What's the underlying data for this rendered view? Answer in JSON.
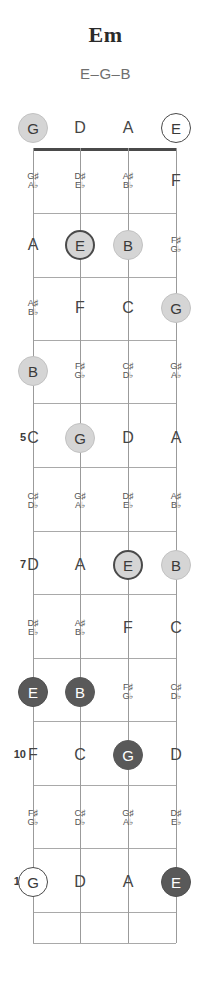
{
  "chord": {
    "name": "Em",
    "notes_label": "E–G–B"
  },
  "fretboard": {
    "tuning": [
      "G",
      "D",
      "A",
      "E"
    ],
    "string_count": 4,
    "fret_count": 12,
    "fret_numbers_shown": [
      "5",
      "7",
      "10",
      "12"
    ],
    "colors": {
      "root_fill": "#595959",
      "chord_fill": "#d5d5d5",
      "open_fill": "#ffffff",
      "line": "#a9a9a9",
      "nut": "#4a4a4a",
      "text": "#3a3a3a"
    },
    "rows": [
      {
        "fret": "0",
        "label": "",
        "cells": [
          {
            "text": "G",
            "style": "chord-light"
          },
          {
            "text": "D",
            "style": "plain"
          },
          {
            "text": "A",
            "style": "plain"
          },
          {
            "text": "E",
            "style": "root-open"
          }
        ]
      },
      {
        "fret": "1",
        "label": "",
        "cells": [
          {
            "text": "G♯|A♭",
            "style": "accidental"
          },
          {
            "text": "D♯|E♭",
            "style": "accidental"
          },
          {
            "text": "A♯|B♭",
            "style": "accidental"
          },
          {
            "text": "F",
            "style": "plain"
          }
        ]
      },
      {
        "fret": "2",
        "label": "",
        "cells": [
          {
            "text": "A",
            "style": "plain"
          },
          {
            "text": "E",
            "style": "root-light"
          },
          {
            "text": "B",
            "style": "chord-light"
          },
          {
            "text": "F♯|G♭",
            "style": "accidental"
          }
        ]
      },
      {
        "fret": "3",
        "label": "",
        "cells": [
          {
            "text": "A♯|B♭",
            "style": "accidental"
          },
          {
            "text": "F",
            "style": "plain"
          },
          {
            "text": "C",
            "style": "plain"
          },
          {
            "text": "G",
            "style": "chord-light"
          }
        ]
      },
      {
        "fret": "4",
        "label": "",
        "cells": [
          {
            "text": "B",
            "style": "chord-light"
          },
          {
            "text": "F♯|G♭",
            "style": "accidental"
          },
          {
            "text": "C♯|D♭",
            "style": "accidental"
          },
          {
            "text": "G♯|A♭",
            "style": "accidental"
          }
        ]
      },
      {
        "fret": "5",
        "label": "5",
        "cells": [
          {
            "text": "C",
            "style": "plain"
          },
          {
            "text": "G",
            "style": "chord-light"
          },
          {
            "text": "D",
            "style": "plain"
          },
          {
            "text": "A",
            "style": "plain"
          }
        ]
      },
      {
        "fret": "6",
        "label": "",
        "cells": [
          {
            "text": "C♯|D♭",
            "style": "accidental"
          },
          {
            "text": "G♯|A♭",
            "style": "accidental"
          },
          {
            "text": "D♯|E♭",
            "style": "accidental"
          },
          {
            "text": "A♯|B♭",
            "style": "accidental"
          }
        ]
      },
      {
        "fret": "7",
        "label": "7",
        "cells": [
          {
            "text": "D",
            "style": "plain"
          },
          {
            "text": "A",
            "style": "plain"
          },
          {
            "text": "E",
            "style": "root-light"
          },
          {
            "text": "B",
            "style": "chord-light"
          }
        ]
      },
      {
        "fret": "8",
        "label": "",
        "cells": [
          {
            "text": "D♯|E♭",
            "style": "accidental"
          },
          {
            "text": "A♯|B♭",
            "style": "accidental"
          },
          {
            "text": "F",
            "style": "plain"
          },
          {
            "text": "C",
            "style": "plain"
          }
        ]
      },
      {
        "fret": "9",
        "label": "",
        "cells": [
          {
            "text": "E",
            "style": "root-dark"
          },
          {
            "text": "B",
            "style": "chord-dark"
          },
          {
            "text": "F♯|G♭",
            "style": "accidental"
          },
          {
            "text": "C♯|D♭",
            "style": "accidental"
          }
        ]
      },
      {
        "fret": "10",
        "label": "10",
        "cells": [
          {
            "text": "F",
            "style": "plain"
          },
          {
            "text": "C",
            "style": "plain"
          },
          {
            "text": "G",
            "style": "chord-dark"
          },
          {
            "text": "D",
            "style": "plain"
          }
        ]
      },
      {
        "fret": "11",
        "label": "",
        "cells": [
          {
            "text": "F♯|G♭",
            "style": "accidental"
          },
          {
            "text": "C♯|D♭",
            "style": "accidental"
          },
          {
            "text": "G♯|A♭",
            "style": "accidental"
          },
          {
            "text": "D♯|E♭",
            "style": "accidental"
          }
        ]
      },
      {
        "fret": "12",
        "label": "12",
        "cells": [
          {
            "text": "G",
            "style": "root-open"
          },
          {
            "text": "D",
            "style": "plain"
          },
          {
            "text": "A",
            "style": "plain"
          },
          {
            "text": "E",
            "style": "root-dark"
          }
        ]
      }
    ]
  }
}
